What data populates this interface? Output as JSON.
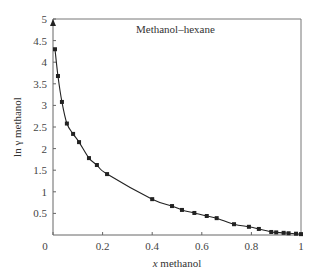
{
  "chart_data": {
    "type": "line",
    "title": "Methanol–hexane",
    "xlabel_italic": "x",
    "xlabel_rest": " methanol",
    "xlabel": "x methanol",
    "ylabel": "ln γ methanol",
    "xlim": [
      0,
      1
    ],
    "ylim": [
      0,
      5
    ],
    "x_ticks": [
      0,
      0.2,
      0.4,
      0.6,
      0.8,
      1
    ],
    "x_tick_labels": [
      "0",
      "0.2",
      "0.4",
      "0.6",
      "0.8",
      "1"
    ],
    "y_ticks": [
      0.5,
      1,
      1.5,
      2,
      2.5,
      3,
      3.5,
      4,
      4.5,
      5
    ],
    "y_tick_labels": [
      "0.5",
      "1",
      "1.5",
      "2",
      "2.5",
      "3",
      "3.5",
      "4",
      "4.5",
      "5"
    ],
    "grid": false,
    "legend": "none",
    "annotations": [
      {
        "type": "arrow-up-marker",
        "x": 0,
        "y": 4.95,
        "meaning": "infinite dilution value"
      }
    ],
    "series": [
      {
        "name": "Methanol–hexane",
        "style": "line-with-square-markers",
        "x": [
          0.008,
          0.02,
          0.036,
          0.056,
          0.081,
          0.105,
          0.145,
          0.177,
          0.218,
          0.4,
          0.48,
          0.52,
          0.57,
          0.62,
          0.66,
          0.73,
          0.79,
          0.83,
          0.88,
          0.9,
          0.93,
          0.95,
          0.98,
          1.0
        ],
        "y": [
          4.3,
          3.68,
          3.08,
          2.58,
          2.34,
          2.15,
          1.78,
          1.62,
          1.41,
          0.83,
          0.67,
          0.58,
          0.51,
          0.44,
          0.39,
          0.25,
          0.19,
          0.14,
          0.07,
          0.06,
          0.05,
          0.04,
          0.03,
          0.02
        ]
      }
    ],
    "colors": {
      "line": "#222222",
      "marker": "#222222",
      "frame": "#777777"
    }
  }
}
